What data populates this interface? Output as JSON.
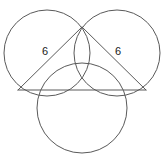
{
  "figure": {
    "kind": "geometry-diagram",
    "background_color": "#ffffff",
    "stroke_color": "#5a5a5a",
    "label_color": "#1a1a1a",
    "canvas": {
      "width": 166,
      "height": 160
    },
    "circles": [
      {
        "name": "upper-left-circle",
        "cx": 47,
        "cy": 53,
        "r": 43
      },
      {
        "name": "upper-right-circle",
        "cx": 117,
        "cy": 53,
        "r": 43
      },
      {
        "name": "bottom-circle",
        "cx": 82,
        "cy": 108,
        "r": 45
      }
    ],
    "points": {
      "apex": {
        "x": 82,
        "y": 27
      },
      "left_vertex": {
        "x": 18,
        "y": 90
      },
      "right_vertex": {
        "x": 146,
        "y": 90
      }
    },
    "segments": [
      {
        "name": "left-leg",
        "x1": 18,
        "y1": 90,
        "x2": 82,
        "y2": 27,
        "label": "6"
      },
      {
        "name": "right-leg",
        "x1": 82,
        "y1": 27,
        "x2": 146,
        "y2": 90,
        "label": "6"
      },
      {
        "name": "base",
        "x1": 18,
        "y1": 90,
        "x2": 146,
        "y2": 90,
        "label": ""
      }
    ],
    "labels": {
      "left_leg_label": "6",
      "right_leg_label": "6",
      "left_leg_label_x": 45,
      "left_leg_label_y": 52,
      "right_leg_label_x": 118,
      "right_leg_label_y": 52
    }
  }
}
